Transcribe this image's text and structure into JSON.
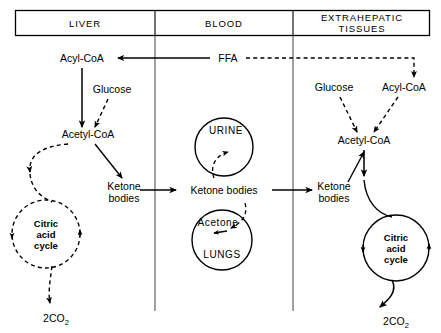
{
  "figure": {
    "compartments": [
      {
        "id": "liver",
        "label": "LIVER"
      },
      {
        "id": "blood",
        "label": "BLOOD"
      },
      {
        "id": "extrahepatic",
        "label": "EXTRAHEPATIC TISSUES",
        "line1": "EXTRAHEPATIC",
        "line2": "TISSUES"
      }
    ]
  },
  "liver": {
    "acyl_coa": "Acyl-CoA",
    "glucose": "Glucose",
    "acetyl_coa": "Acetyl-CoA",
    "ketone_bodies_line1": "Ketone",
    "ketone_bodies_line2": "bodies",
    "cycle_line1": "Citric",
    "cycle_line2": "acid",
    "cycle_line3": "cycle",
    "co2_prefix": "2CO",
    "co2_sub": "2"
  },
  "blood": {
    "ffa": "FFA",
    "urine": "URINE",
    "ketone_bodies": "Ketone bodies",
    "acetone": "Acetone",
    "lungs": "LUNGS"
  },
  "extrahepatic": {
    "glucose": "Glucose",
    "acyl_coa": "Acyl-CoA",
    "acetyl_coa": "Acetyl-CoA",
    "ketone_bodies_line1": "Ketone",
    "ketone_bodies_line2": "bodies",
    "cycle_line1": "Citric",
    "cycle_line2": "acid",
    "cycle_line3": "cycle",
    "co2_prefix": "2CO",
    "co2_sub": "2"
  },
  "colors": {
    "ink": "#000000",
    "background": "#ffffff",
    "divider": "#555555"
  }
}
